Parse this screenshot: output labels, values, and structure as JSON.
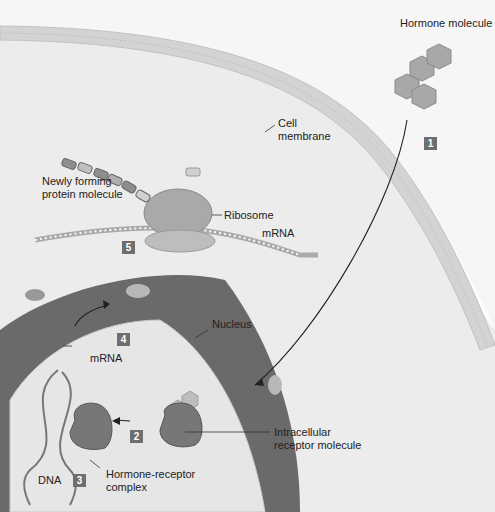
{
  "labels": {
    "hormone": "Hormone molecule",
    "membrane_1": "Cell",
    "membrane_2": "membrane",
    "protein_1": "Newly forming",
    "protein_2": "protein molecule",
    "ribosome": "Ribosome",
    "mrna_top": "mRNA",
    "nucleus": "Nucleus",
    "mrna_nuc": "mRNA",
    "intracellular_1": "Intracellular",
    "intracellular_2": "receptor molecule",
    "dna": "DNA",
    "complex_1": "Hormone-receptor",
    "complex_2": "complex"
  },
  "steps": [
    "1",
    "2",
    "3",
    "4",
    "5"
  ],
  "colors": {
    "cytoplasm": "#ececec",
    "membrane": "#d6d6d6",
    "nuclear_envelope": "#6a6a6a",
    "nucleoplasm": "#e6e6e6",
    "step_badge": "#6e6e6e"
  }
}
